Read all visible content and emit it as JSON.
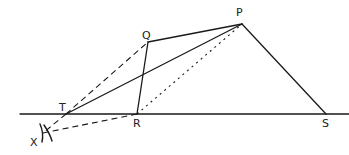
{
  "diagram": {
    "title": "",
    "points": {
      "P": {
        "x": 242,
        "y": 24,
        "label": "P",
        "lx": 236,
        "ly": 16
      },
      "Q": {
        "x": 148,
        "y": 42,
        "label": "Q",
        "lx": 142,
        "ly": 39
      },
      "R": {
        "x": 137,
        "y": 114,
        "label": "R",
        "lx": 133,
        "ly": 127
      },
      "S": {
        "x": 326,
        "y": 114,
        "label": "S",
        "lx": 322,
        "ly": 127
      },
      "T": {
        "x": 66,
        "y": 114,
        "label": "T",
        "lx": 59,
        "ly": 111
      },
      "X": {
        "x": 43,
        "y": 133,
        "label": "X",
        "lx": 30,
        "ly": 146
      }
    },
    "baseline": {
      "x1": 20,
      "y1": 114,
      "x2": 349,
      "y2": 114
    },
    "segments": [
      {
        "from": "Q",
        "to": "P",
        "style": "solid"
      },
      {
        "from": "Q",
        "to": "R",
        "style": "solid"
      },
      {
        "from": "P",
        "to": "S",
        "style": "solid"
      },
      {
        "from": "T",
        "to": "P",
        "style": "solid"
      },
      {
        "from": "T",
        "to": "Q",
        "style": "dashed"
      },
      {
        "from": "R",
        "to": "P",
        "style": "dotted"
      },
      {
        "from": "R",
        "to": "X",
        "style": "dashed"
      },
      {
        "from": "T",
        "to": "X",
        "style": "dashed"
      }
    ]
  }
}
